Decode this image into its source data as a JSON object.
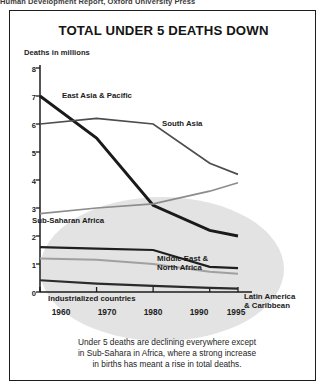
{
  "page_header": "Human Development Report, Oxford University Press",
  "figure": {
    "title": "TOTAL UNDER 5 DEATHS DOWN",
    "axis_caption": "Deaths in millions",
    "caption_lines": [
      "Under 5 deaths are declining everywhere except",
      "in Sub-Sahara in Africa, where a strong increase",
      "in births has meant a rise in total deaths."
    ],
    "series_labels": {
      "east_asia": "East Asia & Pacific",
      "south_asia": "South Asia",
      "sub_saharan": "Sub-Saharan Africa",
      "middle_east_l1": "Middle East &",
      "middle_east_l2": "North Africa",
      "industrialized": "Industrialized countries",
      "latin_america_l1": "Latin America",
      "latin_america_l2": "& Caribbean"
    }
  },
  "chart_data": {
    "type": "line",
    "title": "TOTAL UNDER 5 DEATHS DOWN",
    "subtitle": "",
    "xlabel": "",
    "ylabel": "Deaths in millions",
    "x": [
      1960,
      1970,
      1980,
      1990,
      1995
    ],
    "xtick_labels": [
      "1960",
      "1970",
      "1980",
      "1990",
      "1995"
    ],
    "ytick_labels": [
      "0",
      "1",
      "2",
      "3",
      "4",
      "5",
      "6",
      "7",
      "8"
    ],
    "xlim": [
      1955,
      1998
    ],
    "ylim": [
      0,
      8
    ],
    "grid": false,
    "legend": "inline-annotations",
    "series": [
      {
        "name": "East Asia & Pacific",
        "values": [
          7.0,
          5.5,
          3.1,
          2.2,
          2.0
        ],
        "color": "#1a1a1a",
        "width": 2.9
      },
      {
        "name": "South Asia",
        "values": [
          6.0,
          6.2,
          6.0,
          4.6,
          4.2
        ],
        "color": "#4d4d4d",
        "width": 1.7
      },
      {
        "name": "Sub-Saharan Africa",
        "values": [
          2.8,
          3.0,
          3.15,
          3.6,
          3.9
        ],
        "color": "#8c8c8c",
        "width": 1.7
      },
      {
        "name": "Middle East & North Africa",
        "values": [
          1.6,
          1.55,
          1.5,
          0.9,
          0.85
        ],
        "color": "#1f1f1f",
        "width": 2.2
      },
      {
        "name": "Latin America & Caribbean",
        "values": [
          1.2,
          1.15,
          1.0,
          0.72,
          0.65
        ],
        "color": "#a0a0a0",
        "width": 2.0
      },
      {
        "name": "Industrialized countries",
        "values": [
          0.42,
          0.3,
          0.22,
          0.15,
          0.12
        ],
        "color": "#2b2b2b",
        "width": 2.2
      }
    ],
    "annotations": [
      "Under 5 deaths are declining everywhere except in Sub-Sahara in Africa, where a strong increase in births has meant a rise in total deaths."
    ],
    "background_ellipse_color": "#dedede"
  }
}
